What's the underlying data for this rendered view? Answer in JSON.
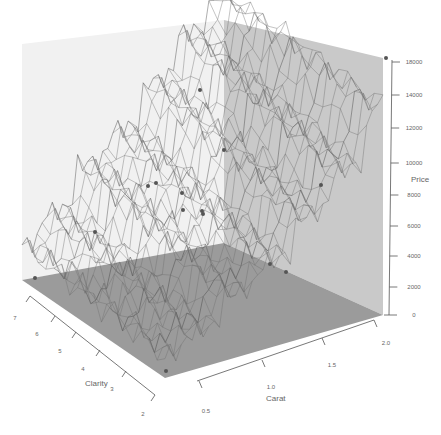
{
  "chart_data": {
    "type": "surface3d",
    "title": "",
    "axes": {
      "x": {
        "label": "Carat",
        "ticks": [
          "0.5",
          "1.0",
          "1.5",
          "2.0"
        ],
        "range": [
          0.5,
          2.0
        ]
      },
      "y": {
        "label": "Clarity",
        "ticks": [
          "2",
          "3",
          "4",
          "5",
          "6",
          "7"
        ],
        "range": [
          2,
          7
        ]
      },
      "z": {
        "label": "Price",
        "ticks": [
          "0",
          "2000",
          "4000",
          "6000",
          "8000",
          "10000",
          "12000",
          "14000",
          "18000"
        ],
        "range": [
          0,
          18000
        ]
      }
    },
    "surface_profile": {
      "note": "Approximate price levels of the wireframe surface stepping up with carat (estimated)",
      "carat": [
        0.5,
        0.75,
        1.0,
        1.25,
        1.5,
        1.75,
        2.0
      ],
      "price_low_clarity": [
        1500,
        2500,
        4500,
        6000,
        8500,
        11000,
        15000
      ],
      "price_high_clarity": [
        2500,
        4500,
        7500,
        9500,
        12500,
        15500,
        18000
      ]
    },
    "colors": {
      "left_wall": "#f2f2f2",
      "right_wall": "#c8c8c8",
      "floor": "#9a9a9a",
      "wire": "#6e6e6e",
      "points": "#555555"
    },
    "grid": false,
    "legend": null
  }
}
